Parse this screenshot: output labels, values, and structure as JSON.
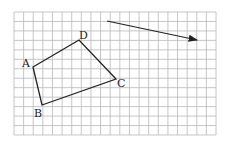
{
  "grid": {
    "x0": 14,
    "y0": 12,
    "cols": 21,
    "rows": 13,
    "cell_w": 9.62,
    "cell_h": 9.46,
    "line_color": "#b8b8b8"
  },
  "quadrilateral": {
    "vertices": [
      {
        "label": "A",
        "x": 33,
        "y": 67,
        "lx": 22,
        "ly": 67
      },
      {
        "label": "B",
        "x": 42,
        "y": 105,
        "lx": 34,
        "ly": 117
      },
      {
        "label": "C",
        "x": 116,
        "y": 79,
        "lx": 117,
        "ly": 87
      },
      {
        "label": "D",
        "x": 79,
        "y": 40,
        "lx": 79,
        "ly": 39
      }
    ],
    "stroke": "#222222"
  },
  "vector": {
    "x1": 107,
    "y1": 21,
    "x2": 197,
    "y2": 40,
    "stroke": "#222222"
  }
}
